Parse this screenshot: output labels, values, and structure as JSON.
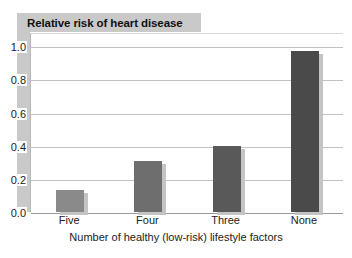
{
  "chart_data": {
    "type": "bar",
    "title": "Relative risk of heart disease",
    "xlabel": "Number of healthy (low-risk) lifestyle factors",
    "ylabel": "Relative risk of heart disease",
    "categories": [
      "Five",
      "Four",
      "Three",
      "None"
    ],
    "values": [
      0.13,
      0.31,
      0.4,
      0.97
    ],
    "bar_colors": [
      "#8a8a8a",
      "#6e6e6e",
      "#595959",
      "#4a4a4a"
    ],
    "ylim": [
      0.0,
      1.08
    ],
    "yticks": [
      "0.0",
      "0.2",
      "0.4",
      "0.6",
      "0.8",
      "1.0"
    ],
    "ytick_values": [
      0.0,
      0.2,
      0.4,
      0.6,
      0.8,
      1.0
    ],
    "grid": true,
    "legend": "none",
    "title_background": "#c9c9c9",
    "gridline_color": "#c2c2c2",
    "axis_color": "#9a9a9a",
    "shadow_color": "#c4c4c4"
  }
}
